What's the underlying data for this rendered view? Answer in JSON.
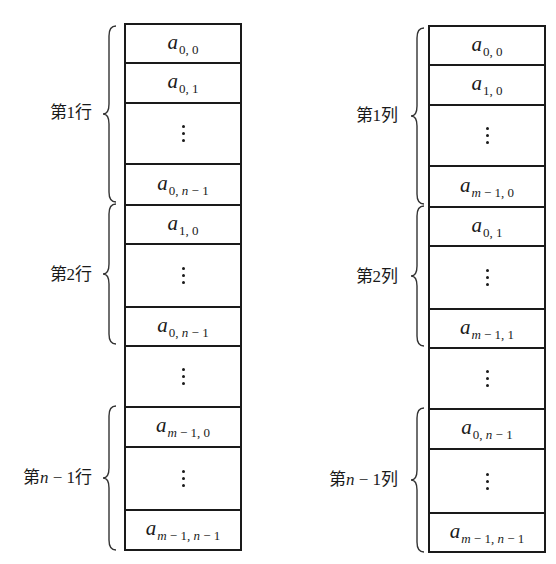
{
  "diagrams": [
    {
      "name": "row-major",
      "groups": [
        {
          "label_prefix": "第",
          "label_index": "1",
          "label_suffix": "行"
        },
        {
          "label_prefix": "第",
          "label_index": "2",
          "label_suffix": "行"
        },
        {
          "label_prefix": "第",
          "label_index_var": "n",
          "label_index": " − 1",
          "label_suffix": "行"
        }
      ],
      "cells": [
        {
          "type": "elem",
          "base": "a",
          "sub": "0, 0"
        },
        {
          "type": "elem",
          "base": "a",
          "sub": "0, 1"
        },
        {
          "type": "vdots"
        },
        {
          "type": "elem",
          "base": "a",
          "sub": "0, n − 1"
        },
        {
          "type": "elem",
          "base": "a",
          "sub": "1, 0"
        },
        {
          "type": "vdots"
        },
        {
          "type": "elem",
          "base": "a",
          "sub": "0, n − 1"
        },
        {
          "type": "vdots"
        },
        {
          "type": "elem",
          "base": "a",
          "sub": "m − 1, 0"
        },
        {
          "type": "vdots"
        },
        {
          "type": "elem",
          "base": "a",
          "sub": "m − 1, n − 1"
        }
      ]
    },
    {
      "name": "column-major",
      "groups": [
        {
          "label_prefix": "第",
          "label_index": "1",
          "label_suffix": "列"
        },
        {
          "label_prefix": "第",
          "label_index": "2",
          "label_suffix": "列"
        },
        {
          "label_prefix": "第",
          "label_index_var": "n",
          "label_index": " − 1",
          "label_suffix": "列"
        }
      ],
      "cells": [
        {
          "type": "elem",
          "base": "a",
          "sub": "0, 0"
        },
        {
          "type": "elem",
          "base": "a",
          "sub": "1, 0"
        },
        {
          "type": "vdots"
        },
        {
          "type": "elem",
          "base": "a",
          "sub": "m − 1, 0"
        },
        {
          "type": "elem",
          "base": "a",
          "sub": "0, 1"
        },
        {
          "type": "vdots"
        },
        {
          "type": "elem",
          "base": "a",
          "sub": "m − 1, 1"
        },
        {
          "type": "vdots"
        },
        {
          "type": "elem",
          "base": "a",
          "sub": "0, n − 1"
        },
        {
          "type": "vdots"
        },
        {
          "type": "elem",
          "base": "a",
          "sub": "m − 1, n − 1"
        }
      ]
    }
  ]
}
